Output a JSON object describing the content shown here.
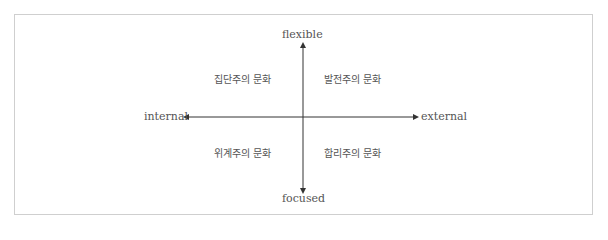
{
  "diagram": {
    "axes": {
      "top": "flexible",
      "bottom": "focused",
      "left": "internal",
      "right": "external"
    },
    "quadrants": {
      "top_left": "집단주의 문화",
      "top_right": "발전주의 문화",
      "bottom_left": "위계주의 문화",
      "bottom_right": "합리주의 문화"
    },
    "colors": {
      "axis": "#333333",
      "text": "#555555",
      "border": "#cfcfcf"
    }
  }
}
